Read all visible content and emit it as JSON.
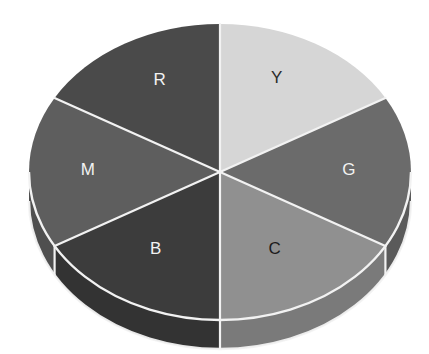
{
  "figure": {
    "title": "",
    "background_color": "#ffffff",
    "width": 429,
    "height": 354
  },
  "chart_data": {
    "type": "pie",
    "title": "",
    "subtitle": "",
    "xlabel": "",
    "ylabel": "",
    "three_d": true,
    "grid": false,
    "legend_position": "none",
    "start_angle_deg": 90,
    "direction": "clockwise",
    "labels_shown_inside": true,
    "categories": [
      "Y",
      "G",
      "C",
      "B",
      "M",
      "R"
    ],
    "values": [
      1,
      1,
      1,
      1,
      1,
      1
    ],
    "percentages": [
      "16.7%",
      "16.7%",
      "16.7%",
      "16.7%",
      "16.7%",
      "16.7%"
    ],
    "slice_angles_deg": [
      60,
      60,
      60,
      60,
      60,
      60
    ],
    "separator_color": "#f2f2f2",
    "slices": [
      {
        "label": "Y",
        "value": 1,
        "angle_deg": 60,
        "start_deg": 90,
        "end_deg": 30,
        "top_color": "#d6d6d6",
        "side_color": "#b4b4b4",
        "label_color": "#2b2b2b",
        "label_x": 277,
        "label_y": 79
      },
      {
        "label": "G",
        "value": 1,
        "angle_deg": 60,
        "start_deg": 30,
        "end_deg": -30,
        "top_color": "#6b6b6b",
        "side_color": "#5a5a5a",
        "label_color": "#f2f2f2",
        "label_x": 349,
        "label_y": 171
      },
      {
        "label": "C",
        "value": 1,
        "angle_deg": 60,
        "start_deg": -30,
        "end_deg": -90,
        "top_color": "#909090",
        "side_color": "#7a7a7a",
        "label_color": "#1c1c1c",
        "label_x": 275,
        "label_y": 250
      },
      {
        "label": "B",
        "value": 1,
        "angle_deg": 60,
        "start_deg": -90,
        "end_deg": -150,
        "top_color": "#3c3c3c",
        "side_color": "#333333",
        "label_color": "#f2f2f2",
        "label_x": 156,
        "label_y": 250
      },
      {
        "label": "M",
        "value": 1,
        "angle_deg": 60,
        "start_deg": -150,
        "end_deg": -210,
        "top_color": "#5e5e5e",
        "side_color": "#4f4f4f",
        "label_color": "#f2f2f2",
        "label_x": 88,
        "label_y": 171
      },
      {
        "label": "R",
        "value": 1,
        "angle_deg": 60,
        "start_deg": 150,
        "end_deg": 90,
        "top_color": "#4a4a4a",
        "side_color": "#3f3f3f",
        "label_color": "#f2f2f2",
        "label_x": 160,
        "label_y": 81
      }
    ],
    "geometry": {
      "center_x": 220,
      "center_y": 172,
      "radius_x": 191,
      "radius_y": 148,
      "depth": 29
    }
  }
}
